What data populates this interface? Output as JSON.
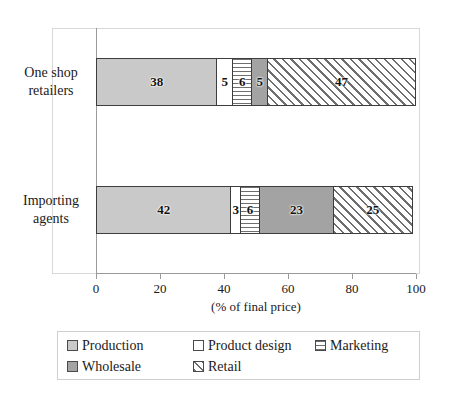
{
  "chart_data": {
    "type": "bar",
    "orientation": "horizontal",
    "stacked": true,
    "title": "",
    "xlabel": "(% of final price)",
    "ylabel": "",
    "xlim": [
      0,
      100
    ],
    "xticks": [
      0,
      20,
      40,
      60,
      80,
      100
    ],
    "xtick_labels": [
      "0",
      "20",
      "40",
      "60",
      "80",
      "100"
    ],
    "grid": false,
    "legend_position": "bottom",
    "categories": [
      "One shop retailers",
      "Importing agents"
    ],
    "category_lines": [
      [
        "One shop",
        "retailers"
      ],
      [
        "Importing",
        "agents"
      ]
    ],
    "series": [
      {
        "name": "Production",
        "values": [
          38,
          42
        ],
        "swatch": "fill-production",
        "pattern": "solid-light-gray",
        "color": "#c9c9c9"
      },
      {
        "name": "Product design",
        "values": [
          5,
          3
        ],
        "swatch": "fill-design",
        "pattern": "solid-white",
        "color": "#ffffff"
      },
      {
        "name": "Marketing",
        "values": [
          6,
          6
        ],
        "swatch": "fill-marketing",
        "pattern": "horizontal-lines",
        "color": "#ffffff"
      },
      {
        "name": "Wholesale",
        "values": [
          5,
          23
        ],
        "swatch": "fill-wholesale",
        "pattern": "solid-dark-gray",
        "color": "#a3a3a3"
      },
      {
        "name": "Retail",
        "values": [
          47,
          25
        ],
        "swatch": "fill-retail",
        "pattern": "diagonal-hatch",
        "color": "#ffffff"
      }
    ]
  },
  "axis": {
    "title": "(% of final price)",
    "ticks": [
      {
        "label": "0",
        "value": 0
      },
      {
        "label": "20",
        "value": 20
      },
      {
        "label": "40",
        "value": 40
      },
      {
        "label": "60",
        "value": 60
      },
      {
        "label": "80",
        "value": 80
      },
      {
        "label": "100",
        "value": 100
      }
    ]
  },
  "legend": {
    "entries": [
      {
        "label": "Production",
        "swatch": "fill-production"
      },
      {
        "label": "Product design",
        "swatch": "fill-design"
      },
      {
        "label": "Marketing",
        "swatch": "fill-marketing"
      },
      {
        "label": "Wholesale",
        "swatch": "fill-wholesale"
      },
      {
        "label": "Retail",
        "swatch": "fill-retail"
      }
    ]
  }
}
